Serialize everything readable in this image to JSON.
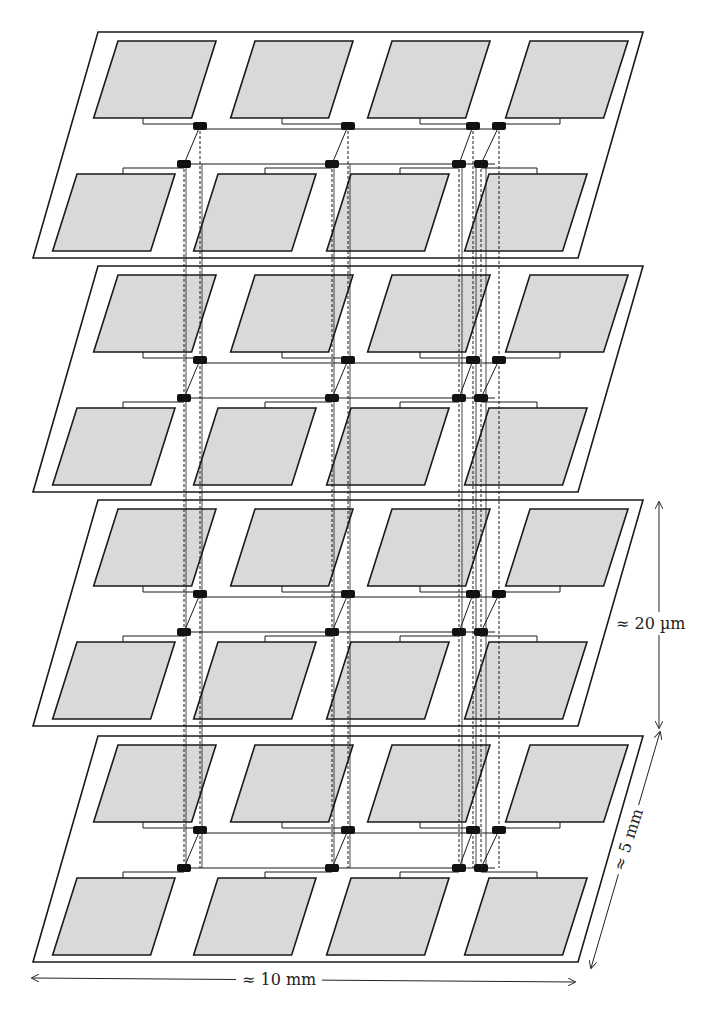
{
  "figure": {
    "layers": 4,
    "pads_per_layer": {
      "rows": 2,
      "cols": 4
    },
    "colors": {
      "pad_fill": "#d9d9d9",
      "outline": "#1a1a1a",
      "node_fill": "#111111",
      "background": "#ffffff"
    }
  },
  "dimensions": {
    "height_label": "≈ 20 µm",
    "depth_label": "≈ 5 mm",
    "width_label": "≈ 10 mm"
  }
}
